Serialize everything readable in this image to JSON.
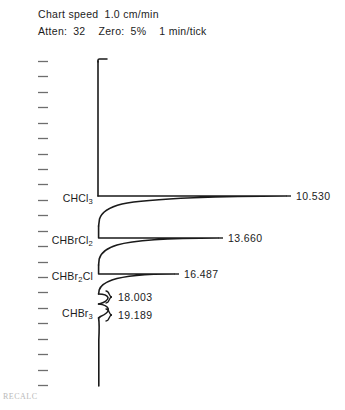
{
  "header": {
    "chart_speed_label": "Chart speed",
    "chart_speed_value": "1.0 cm/min",
    "atten_label": "Atten:",
    "atten_value": "32",
    "zero_label": "Zero:",
    "zero_value": "5%",
    "tick_interval": "1 min/tick"
  },
  "footer": {
    "text": "RECALC"
  },
  "axis": {
    "tick_count": 22,
    "tick_unit": "1 min/tick",
    "orientation": "vertical-time-downward"
  },
  "chart_data": {
    "type": "line",
    "subtitle": "Chart speed 1.0 cm/min   Atten: 32   Zero: 5%   1 min/tick",
    "xlabel": "Detector response",
    "ylabel": "Retention time (min)",
    "orientation": "horizontal-peaks-vertical-baseline",
    "grid": false,
    "legend": false,
    "baseline_value": 0,
    "peaks": [
      {
        "compound": "CHCl3",
        "compound_display": "CHCl",
        "compound_subscript": "3",
        "retention_time": 10.53,
        "retention_time_label": "10.530",
        "relative_height": 1.0,
        "apex_y_px": 196,
        "tail_extent_px": 286,
        "leader_line": true
      },
      {
        "compound": "CHBrCl2",
        "compound_display": "CHBrCl",
        "compound_subscript": "2",
        "retention_time": 13.66,
        "retention_time_label": "13.660",
        "relative_height": 0.74,
        "apex_y_px": 238,
        "tail_extent_px": 218,
        "leader_line": true
      },
      {
        "compound": "CHBr2Cl",
        "compound_display": "CHBr",
        "compound_subscript": "2",
        "compound_suffix": "Cl",
        "retention_time": 16.487,
        "retention_time_label": "16.487",
        "relative_height": 0.54,
        "apex_y_px": 274,
        "tail_extent_px": 174,
        "leader_line": true
      },
      {
        "compound": "CHBr3",
        "compound_display": "CHBr",
        "compound_subscript": "3",
        "retention_time": 18.003,
        "retention_time_label": "18.003",
        "relative_height": 0.06,
        "apex_y_px": 296,
        "tail_extent_px": 108,
        "leader_line": false
      },
      {
        "compound": "CHBr3",
        "compound_display": "CHBr",
        "compound_subscript": "3",
        "retention_time": 19.189,
        "retention_time_label": "19.189",
        "relative_height": 0.06,
        "apex_y_px": 314,
        "tail_extent_px": 108,
        "leader_line": false
      }
    ],
    "compound_labels": [
      {
        "text": "CHCl",
        "sub": "3",
        "tail": "",
        "y_px": 198
      },
      {
        "text": "CHBrCl",
        "sub": "2",
        "tail": "",
        "y_px": 240
      },
      {
        "text": "CHBr",
        "sub": "2",
        "tail": "Cl",
        "y_px": 276
      },
      {
        "text": "CHBr",
        "sub": "3",
        "tail": "",
        "y_px": 313
      }
    ],
    "rt_labels": [
      {
        "text": "10.530",
        "x_px": 296,
        "y_px": 196
      },
      {
        "text": "13.660",
        "x_px": 228,
        "y_px": 238
      },
      {
        "text": "16.487",
        "x_px": 184,
        "y_px": 274
      },
      {
        "text": "18.003",
        "x_px": 118,
        "y_px": 297
      },
      {
        "text": "19.189",
        "x_px": 118,
        "y_px": 315
      }
    ]
  },
  "colors": {
    "trace": "#1a1a1a",
    "tick": "#6e6e6e",
    "text": "#1c1c1c",
    "background": "#ffffff",
    "footer": "#b9b9b9"
  }
}
